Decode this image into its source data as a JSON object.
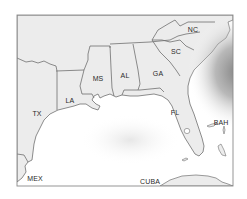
{
  "map": {
    "title": "Southeastern United States and Gulf of Mexico",
    "colors": {
      "land": "#ececec",
      "water": "#ffffff",
      "border": "#707070",
      "frame": "#8a8a8a",
      "text": "#2a2a2a",
      "storm_shading": "#8c8c8c"
    },
    "labels": {
      "tx": {
        "text": "TX",
        "x": 37,
        "y": 113
      },
      "la": {
        "text": "LA",
        "x": 70,
        "y": 100
      },
      "ms": {
        "text": "MS",
        "x": 98,
        "y": 78
      },
      "al": {
        "text": "AL",
        "x": 125,
        "y": 75
      },
      "ga": {
        "text": "GA",
        "x": 158,
        "y": 73
      },
      "sc": {
        "text": "SC",
        "x": 176,
        "y": 51
      },
      "nc": {
        "text": "NC",
        "x": 193,
        "y": 29
      },
      "fl": {
        "text": "FL",
        "x": 175,
        "y": 112
      },
      "bah": {
        "text": "BAH",
        "x": 221,
        "y": 122
      },
      "mex": {
        "text": "MEX",
        "x": 35,
        "y": 178
      },
      "cuba": {
        "text": "CUBA",
        "x": 150,
        "y": 181
      }
    }
  }
}
